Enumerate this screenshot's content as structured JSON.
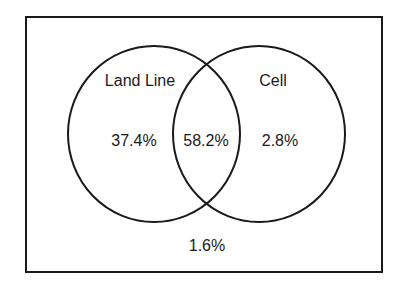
{
  "diagram": {
    "type": "venn",
    "sets": [
      {
        "label": "Land Line",
        "only_value": "37.4%"
      },
      {
        "label": "Cell",
        "only_value": "2.8%"
      }
    ],
    "intersection_value": "58.2%",
    "outside_value": "1.6%",
    "colors": {
      "stroke": "#1a1a1a",
      "background": "#ffffff"
    }
  }
}
